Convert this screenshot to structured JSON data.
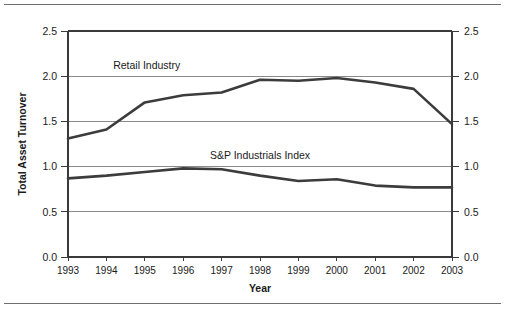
{
  "chart_data": {
    "type": "line",
    "title": "",
    "xlabel": "Year",
    "ylabel": "Total Asset Turnover",
    "categories": [
      "1993",
      "1994",
      "1995",
      "1996",
      "1997",
      "1998",
      "1999",
      "2000",
      "2001",
      "2002",
      "2003"
    ],
    "x": [
      1993,
      1994,
      1995,
      1996,
      1997,
      1998,
      1999,
      2000,
      2001,
      2002,
      2003
    ],
    "ylim": [
      0.0,
      2.5
    ],
    "yticks": [
      "0.0",
      "0.5",
      "1.0",
      "1.5",
      "2.0",
      "2.5"
    ],
    "ytick_values": [
      0.0,
      0.5,
      1.0,
      1.5,
      2.0,
      2.5
    ],
    "grid": true,
    "right_axis": true,
    "right_yticks": [
      "0.0",
      "0.5",
      "1.0",
      "1.5",
      "2.0",
      "2.5"
    ],
    "legend_position": "inline-annotation",
    "line_color": "#3c3c3c",
    "grid_color": "#8a8a8a",
    "series": [
      {
        "name": "Retail Industry",
        "label_x": 1995.05,
        "label_y": 2.08,
        "values": [
          1.31,
          1.41,
          1.71,
          1.79,
          1.82,
          1.96,
          1.95,
          1.98,
          1.93,
          1.86,
          1.47
        ]
      },
      {
        "name": "S&P Industrials Index",
        "label_x": 1998.0,
        "label_y": 1.08,
        "values": [
          0.87,
          0.9,
          0.94,
          0.98,
          0.97,
          0.9,
          0.84,
          0.86,
          0.79,
          0.77,
          0.77
        ]
      }
    ]
  }
}
